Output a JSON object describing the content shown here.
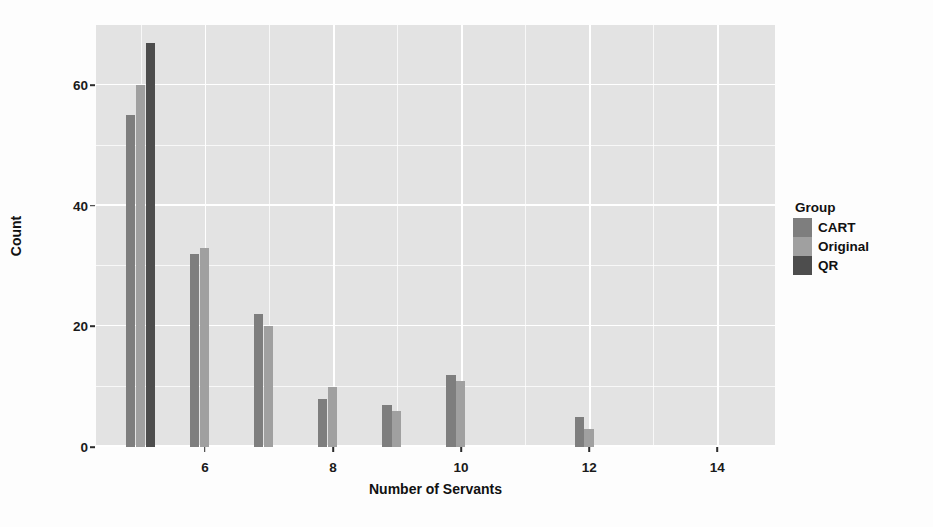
{
  "chart_data": {
    "type": "bar",
    "title": "",
    "subtitle": "",
    "xlabel": "Number of Servants",
    "ylabel": "Count",
    "xlim": [
      4.3,
      14.9
    ],
    "ylim": [
      0,
      70
    ],
    "x": [
      5,
      6,
      7,
      8,
      9,
      10,
      12
    ],
    "xtick_labels": [
      "6",
      "8",
      "10",
      "12",
      "14"
    ],
    "xtick_values": [
      6,
      8,
      10,
      12,
      14
    ],
    "ytick_labels": [
      "0",
      "20",
      "40",
      "60"
    ],
    "ytick_values": [
      0,
      20,
      40,
      60
    ],
    "grid": true,
    "grid_major_y": [
      0,
      20,
      40,
      60
    ],
    "grid_minor_y": [
      10,
      30,
      50
    ],
    "grid_major_x": [
      6,
      8,
      10,
      12,
      14
    ],
    "grid_minor_x": [
      5,
      7,
      9,
      11,
      13
    ],
    "legend_position": "right",
    "legend_title": "Group",
    "panel_background": "#e3e3e3",
    "grid_color": "#ffffff",
    "series": [
      {
        "name": "CART",
        "color": "#7e7e7e",
        "categories": [
          5,
          6,
          7,
          8,
          9,
          10,
          12
        ],
        "values": [
          55,
          32,
          22,
          8,
          7,
          12,
          5
        ]
      },
      {
        "name": "Original",
        "color": "#a0a0a0",
        "categories": [
          5,
          6,
          7,
          8,
          9,
          10,
          12
        ],
        "values": [
          60,
          33,
          20,
          10,
          6,
          11,
          3
        ]
      },
      {
        "name": "QR",
        "color": "#4d4d4d",
        "categories": [
          5,
          6,
          7,
          8,
          9,
          10,
          12
        ],
        "values": [
          67,
          0,
          0,
          0,
          0,
          0,
          0
        ]
      }
    ]
  },
  "legend": {
    "title": "Group",
    "entries": [
      {
        "label": "CART",
        "color": "#7e7e7e"
      },
      {
        "label": "Original",
        "color": "#a0a0a0"
      },
      {
        "label": "QR",
        "color": "#4d4d4d"
      }
    ]
  },
  "axes": {
    "x_label": "Number of Servants",
    "y_label": "Count"
  }
}
